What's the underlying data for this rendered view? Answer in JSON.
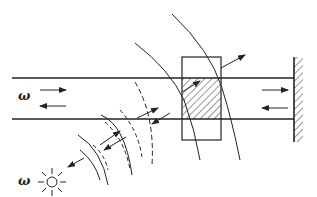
{
  "diagram": {
    "labels": {
      "omega_tube": "ω",
      "omega_source": "ω"
    },
    "components": [
      "waveguide-tube",
      "sample-block",
      "reflecting-wall",
      "point-source",
      "spherical-wavefronts"
    ],
    "colors": {
      "ink": "#222222",
      "background": "#ffffff"
    }
  }
}
